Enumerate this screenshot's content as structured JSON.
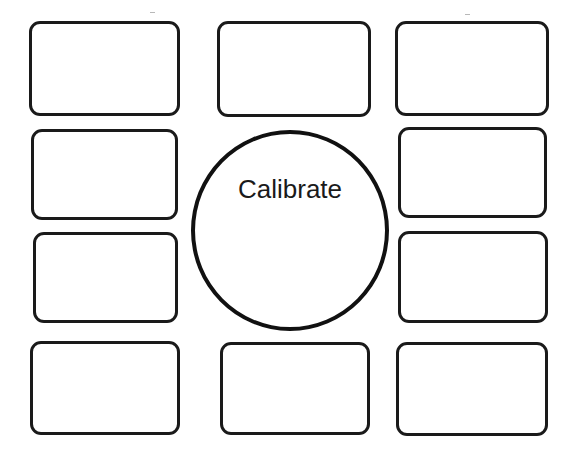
{
  "canvas": {
    "width": 575,
    "height": 455,
    "background": "#ffffff"
  },
  "calibrate_button": {
    "label": "Calibrate",
    "shape": "circle",
    "x": 191,
    "y": 130,
    "width": 198,
    "height": 201,
    "stroke": "#111111"
  },
  "tiles": [
    {
      "id": "tile-1",
      "row": 1,
      "col": "left",
      "x": 29,
      "y": 21,
      "width": 151,
      "height": 95,
      "label": ""
    },
    {
      "id": "tile-2",
      "row": 1,
      "col": "center",
      "x": 217,
      "y": 21,
      "width": 154,
      "height": 96,
      "label": ""
    },
    {
      "id": "tile-3",
      "row": 1,
      "col": "right",
      "x": 395,
      "y": 21,
      "width": 154,
      "height": 95,
      "label": ""
    },
    {
      "id": "tile-4",
      "row": 2,
      "col": "left",
      "x": 31,
      "y": 129,
      "width": 147,
      "height": 91,
      "label": ""
    },
    {
      "id": "tile-5",
      "row": 2,
      "col": "right",
      "x": 398,
      "y": 127,
      "width": 149,
      "height": 91,
      "label": ""
    },
    {
      "id": "tile-6",
      "row": 3,
      "col": "left",
      "x": 33,
      "y": 232,
      "width": 145,
      "height": 91,
      "label": ""
    },
    {
      "id": "tile-7",
      "row": 3,
      "col": "right",
      "x": 398,
      "y": 231,
      "width": 150,
      "height": 92,
      "label": ""
    },
    {
      "id": "tile-8",
      "row": 4,
      "col": "left",
      "x": 30,
      "y": 341,
      "width": 150,
      "height": 94,
      "label": ""
    },
    {
      "id": "tile-9",
      "row": 4,
      "col": "center",
      "x": 220,
      "y": 342,
      "width": 150,
      "height": 93,
      "label": ""
    },
    {
      "id": "tile-10",
      "row": 4,
      "col": "right",
      "x": 396,
      "y": 342,
      "width": 152,
      "height": 94,
      "label": ""
    }
  ],
  "colors": {
    "stroke": "#1a1a1a",
    "fill": "#ffffff",
    "text": "#1a1a1a"
  }
}
